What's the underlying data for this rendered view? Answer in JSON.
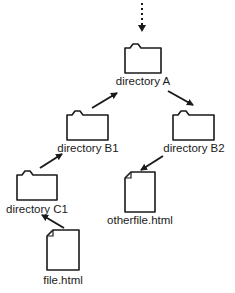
{
  "diagram": {
    "type": "directory-tree",
    "colors": {
      "stroke": "#1a1a1a",
      "background": "#ffffff"
    },
    "nodes": [
      {
        "id": "dirA",
        "kind": "folder",
        "label": "directory A"
      },
      {
        "id": "dirB1",
        "kind": "folder",
        "label": "directory B1"
      },
      {
        "id": "dirB2",
        "kind": "folder",
        "label": "directory B2"
      },
      {
        "id": "dirC1",
        "kind": "folder",
        "label": "directory C1"
      },
      {
        "id": "otherfile",
        "kind": "file",
        "label": "otherfile.html"
      },
      {
        "id": "file",
        "kind": "file",
        "label": "file.html"
      }
    ],
    "edges": [
      {
        "from": "parent",
        "to": "dirA",
        "style": "dotted"
      },
      {
        "from": "dirB1",
        "to": "dirA",
        "style": "solid"
      },
      {
        "from": "dirA",
        "to": "dirB2",
        "style": "solid"
      },
      {
        "from": "dirC1",
        "to": "dirB1",
        "style": "solid"
      },
      {
        "from": "dirB2",
        "to": "otherfile",
        "style": "solid"
      },
      {
        "from": "file",
        "to": "dirC1",
        "style": "solid"
      }
    ]
  }
}
